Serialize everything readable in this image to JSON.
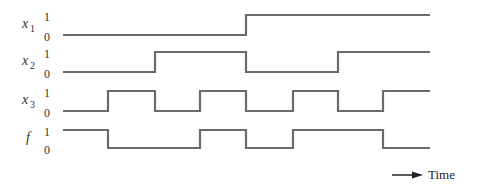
{
  "diagram": {
    "time_label": "Time",
    "level_high_label": "1",
    "level_low_label": "0",
    "stroke_color": "#6b6b6b",
    "time_boundaries_px": [
      63,
      108,
      155,
      200,
      246,
      293,
      338,
      383,
      430
    ],
    "signals": [
      {
        "name": "x",
        "subscript": "1",
        "high_y": 15,
        "low_y": 35,
        "values": [
          0,
          0,
          0,
          0,
          1,
          1,
          1,
          1
        ]
      },
      {
        "name": "x",
        "subscript": "2",
        "high_y": 52,
        "low_y": 72,
        "values": [
          0,
          0,
          1,
          1,
          0,
          0,
          1,
          1
        ]
      },
      {
        "name": "x",
        "subscript": "3",
        "high_y": 91,
        "low_y": 111,
        "values": [
          0,
          1,
          0,
          1,
          0,
          1,
          0,
          1
        ]
      },
      {
        "name": "f",
        "subscript": "",
        "high_y": 130,
        "low_y": 148,
        "values": [
          1,
          0,
          0,
          1,
          0,
          1,
          1,
          0
        ]
      }
    ]
  }
}
